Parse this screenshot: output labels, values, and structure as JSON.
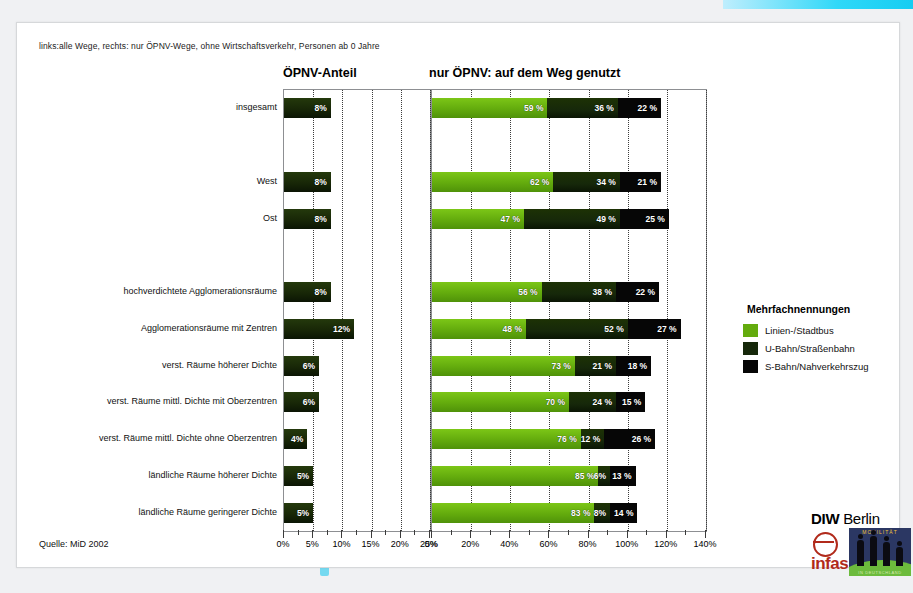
{
  "subnote": "links:alle Wege, rechts: nur ÖPNV-Wege, ohne Wirtschaftsverkehr, Personen ab 0 Jahre",
  "titles": {
    "left": "ÖPNV-Anteil",
    "right": "nur ÖPNV: auf dem Weg genutzt"
  },
  "source": "Quelle: MiD 2002",
  "legend": {
    "title": "Mehrfachnennungen",
    "items": [
      {
        "label": "Linien-/Stadtbus",
        "color": "#63ab0d"
      },
      {
        "label": "U-Bahn/Straßenbahn",
        "color": "#16280a"
      },
      {
        "label": "S-Bahn/Nahverkehrszug",
        "color": "#060606"
      }
    ]
  },
  "logo": {
    "diw_bold": "DIW",
    "diw_light": "Berlin",
    "infas": "infas",
    "mobilitaet": "MOBILITÄT",
    "mob_foot": "IN DEUTSCHLAND"
  },
  "chart_data": {
    "type": "bar",
    "subtitle": "links:alle Wege, rechts: nur ÖPNV-Wege, ohne Wirtschaftsverkehr, Personen ab 0 Jahre",
    "orientation": "horizontal",
    "grid": true,
    "legend_position": "right",
    "categories": [
      "insgesamt",
      "",
      "West",
      "Ost",
      "",
      "hochverdichtete Agglomerationsräume",
      "Agglomerationsräume mit  Zentren",
      "verst. Räume höherer Dichte",
      "verst. Räume mittl. Dichte mit Oberzentren",
      "verst. Räume mittl. Dichte ohne Oberzentren",
      "ländliche Räume höherer Dichte",
      "ländliche Räume geringerer Dichte"
    ],
    "panels": [
      {
        "name": "left",
        "title": "ÖPNV-Anteil",
        "xlabel": "",
        "ylabel": "",
        "xlim": [
          0,
          25
        ],
        "xticks": [
          0,
          5,
          10,
          15,
          20,
          25
        ],
        "xticklabels": [
          "0%",
          "5%",
          "10%",
          "15%",
          "20%",
          "25%"
        ],
        "minor_tick_step": 2.5,
        "series": [
          {
            "name": "ÖPNV-Anteil",
            "color": "#1a2c08",
            "values": [
              8,
              null,
              8,
              8,
              null,
              8,
              12,
              6,
              6,
              4,
              5,
              5
            ],
            "labels": [
              "8%",
              "",
              "8%",
              "8%",
              "",
              "8%",
              "12%",
              "6%",
              "6%",
              "4%",
              "5%",
              "5%"
            ]
          }
        ]
      },
      {
        "name": "right",
        "title": "nur ÖPNV: auf dem Weg genutzt",
        "xlabel": "",
        "ylabel": "",
        "xlim": [
          0,
          140
        ],
        "xticks": [
          0,
          20,
          40,
          60,
          80,
          100,
          120,
          140
        ],
        "xticklabels": [
          "0%",
          "20%",
          "40%",
          "60%",
          "80%",
          "100%",
          "120%",
          "140%"
        ],
        "minor_tick_step": 10,
        "stacked": true,
        "series": [
          {
            "name": "Linien-/Stadtbus",
            "color": "#63ab0d",
            "values": [
              59,
              null,
              62,
              47,
              null,
              56,
              48,
              73,
              70,
              76,
              85,
              83
            ],
            "labels": [
              "59 %",
              "",
              "62 %",
              "47 %",
              "",
              "56 %",
              "48 %",
              "73 %",
              "70 %",
              "76 %",
              "85 %",
              "83 %"
            ]
          },
          {
            "name": "U-Bahn/Straßenbahn",
            "color": "#16280a",
            "values": [
              36,
              null,
              34,
              49,
              null,
              38,
              52,
              21,
              24,
              12,
              6,
              8
            ],
            "labels": [
              "36 %",
              "",
              "34 %",
              "49 %",
              "",
              "38 %",
              "52 %",
              "21 %",
              "24 %",
              "12 %",
              "6%",
              "8%"
            ]
          },
          {
            "name": "S-Bahn/Nahverkehrszug",
            "color": "#060606",
            "values": [
              22,
              null,
              21,
              25,
              null,
              22,
              27,
              18,
              15,
              26,
              13,
              14
            ],
            "labels": [
              "22 %",
              "",
              "21 %",
              "25 %",
              "",
              "22 %",
              "27 %",
              "18 %",
              "15 %",
              "26 %",
              "13 %",
              "14 %"
            ]
          }
        ]
      }
    ]
  }
}
